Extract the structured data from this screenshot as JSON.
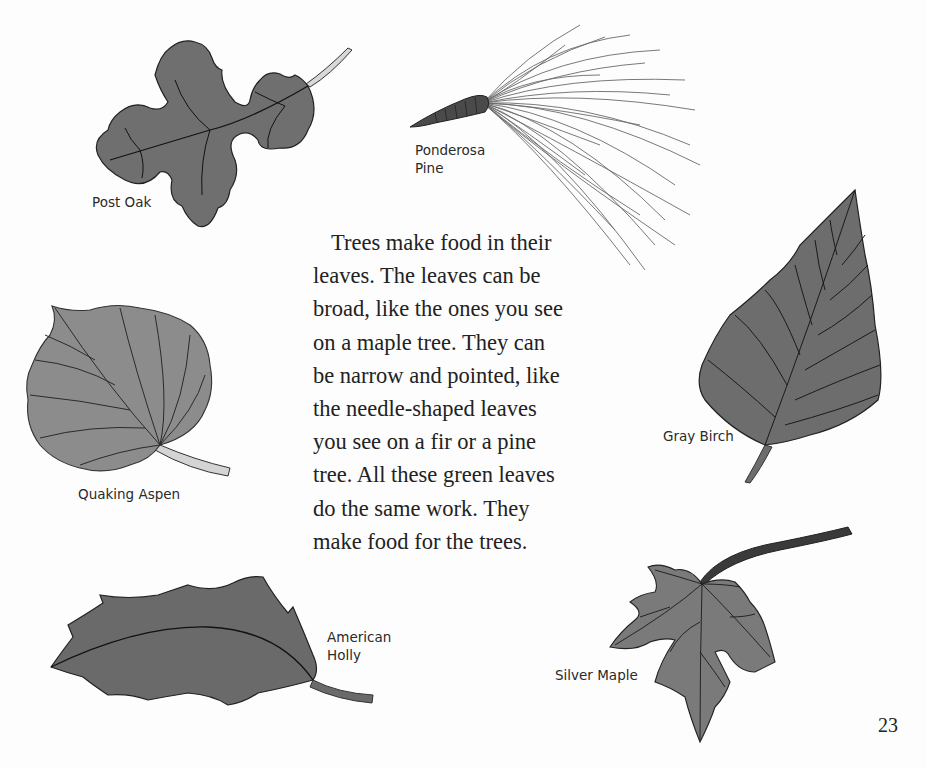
{
  "page": {
    "page_number": "23",
    "background_color": "#fdfdfd",
    "text_color": "#222222"
  },
  "body_text": {
    "lines": [
      "Trees make food in their",
      "leaves. The leaves can be",
      "broad, like the ones you see",
      "on a maple tree. They can",
      "be narrow and pointed, like",
      "the needle-shaped leaves",
      "you see on a fir or a pine",
      "tree. All these green leaves",
      "do the same work. They",
      "make food for the trees."
    ]
  },
  "illustrations": {
    "post_oak": {
      "caption": "Post Oak",
      "fill": "#6f6f6f"
    },
    "ponderosa_pine": {
      "caption": "Ponderosa\nPine",
      "fill": "#555555"
    },
    "quaking_aspen": {
      "caption": "Quaking Aspen",
      "fill": "#8c8c8c"
    },
    "gray_birch": {
      "caption": "Gray Birch",
      "fill": "#6d6d6d"
    },
    "american_holly": {
      "caption": "American\nHolly",
      "fill": "#6a6a6a"
    },
    "silver_maple": {
      "caption": "Silver Maple",
      "fill": "#7a7a7a"
    }
  }
}
